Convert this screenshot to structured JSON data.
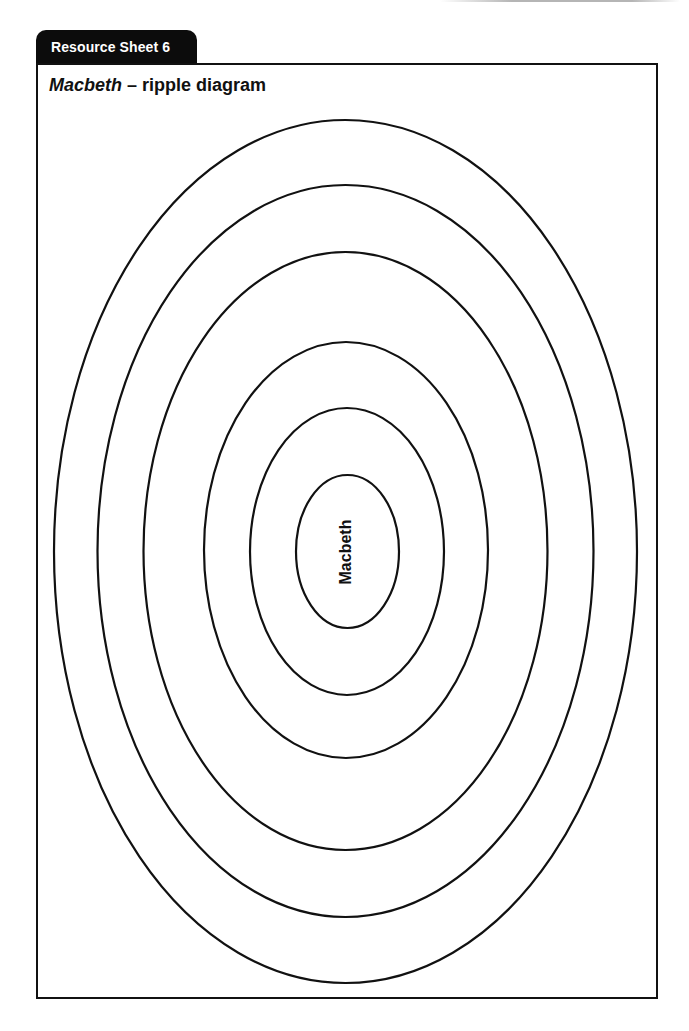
{
  "header": {
    "tab_label": "Resource Sheet 6",
    "title_italic": "Macbeth",
    "title_rest": " – ripple diagram"
  },
  "diagram": {
    "type": "ripple",
    "center_label": "Macbeth",
    "ring_count": 6,
    "ring_labels": [
      "Macbeth",
      "",
      "",
      "",
      "",
      ""
    ],
    "stroke_color": "#111111"
  }
}
